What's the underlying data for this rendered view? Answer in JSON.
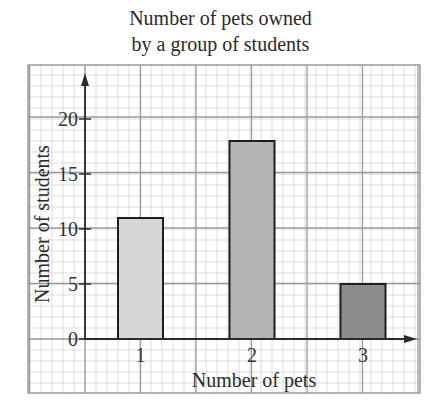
{
  "title_line1": "Number of pets owned",
  "title_line2": "by a group of students",
  "colors": {
    "background": "#ffffff",
    "minor_grid": "#d4d4d4",
    "major_grid": "#9a9a9a",
    "axis": "#2b2b2b",
    "bar_outline": "#1e1e1e",
    "bar_fills": [
      "#d6d6d6",
      "#b5b5b5",
      "#8c8c8c"
    ]
  },
  "chart_data": {
    "type": "bar",
    "xlabel": "Number of pets",
    "ylabel": "Number of students",
    "categories": [
      "1",
      "2",
      "3"
    ],
    "values": [
      11,
      18,
      5
    ],
    "yticks": [
      0,
      5,
      10,
      15,
      20
    ],
    "ylim": [
      0,
      24
    ],
    "grid": true,
    "legend": null
  }
}
